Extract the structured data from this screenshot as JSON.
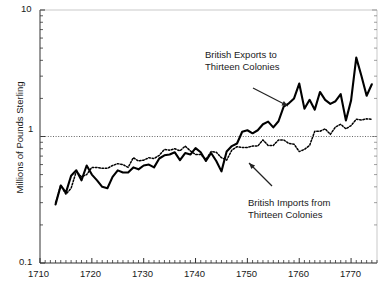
{
  "chart_data": {
    "type": "line",
    "title": "",
    "xlabel": "",
    "ylabel": "Millions of Pounds Sterling",
    "yscale": "log",
    "ylim": [
      0.1,
      10
    ],
    "xlim": [
      1710,
      1775
    ],
    "grid": "dotted horizontal gridline at y = 1",
    "legend_position": "inline annotations with arrows",
    "yticks_major": [
      "0.1",
      "1",
      "10"
    ],
    "xticks_major": [
      "1710",
      "1720",
      "1730",
      "1740",
      "1750",
      "1760",
      "1770"
    ],
    "xtick_minor_interval": 1,
    "annotations": [
      {
        "id": "exports-annotation",
        "line1": "British Exports to",
        "line2": "Thirteen Colonies",
        "arrow_from": [
          253,
          88
        ],
        "arrow_to": [
          288,
          106
        ]
      },
      {
        "id": "imports-annotation",
        "line1": "British Imports from",
        "line2": "Thirteen Colonies",
        "arrow_from": [
          272,
          186
        ],
        "arrow_to": [
          249,
          163
        ]
      }
    ],
    "series": [
      {
        "name": "British Exports to Thirteen Colonies",
        "style": "solid",
        "color": "#000000",
        "x": [
          1713,
          1714,
          1715,
          1716,
          1717,
          1718,
          1719,
          1720,
          1721,
          1722,
          1723,
          1724,
          1725,
          1726,
          1727,
          1728,
          1729,
          1730,
          1731,
          1732,
          1733,
          1734,
          1735,
          1736,
          1737,
          1738,
          1739,
          1740,
          1741,
          1742,
          1743,
          1744,
          1745,
          1746,
          1747,
          1748,
          1749,
          1750,
          1751,
          1752,
          1753,
          1754,
          1755,
          1756,
          1757,
          1758,
          1759,
          1760,
          1761,
          1762,
          1763,
          1764,
          1765,
          1766,
          1767,
          1768,
          1769,
          1770,
          1771,
          1772,
          1773,
          1774
        ],
        "y": [
          0.29,
          0.41,
          0.36,
          0.49,
          0.54,
          0.45,
          0.59,
          0.5,
          0.45,
          0.4,
          0.39,
          0.48,
          0.54,
          0.52,
          0.52,
          0.57,
          0.55,
          0.59,
          0.6,
          0.57,
          0.67,
          0.71,
          0.72,
          0.75,
          0.65,
          0.74,
          0.72,
          0.81,
          0.75,
          0.64,
          0.74,
          0.64,
          0.53,
          0.76,
          0.84,
          0.88,
          1.09,
          1.12,
          1.06,
          1.12,
          1.25,
          1.31,
          1.18,
          1.32,
          1.72,
          1.83,
          2.0,
          2.62,
          1.66,
          1.95,
          1.63,
          2.25,
          1.95,
          1.81,
          1.9,
          2.16,
          1.34,
          1.93,
          4.2,
          3.01,
          2.1,
          2.59
        ]
      },
      {
        "name": "British Imports from Thirteen Colonies",
        "style": "dotted",
        "color": "#000000",
        "x": [
          1713,
          1714,
          1715,
          1716,
          1717,
          1718,
          1719,
          1720,
          1721,
          1722,
          1723,
          1724,
          1725,
          1726,
          1727,
          1728,
          1729,
          1730,
          1731,
          1732,
          1733,
          1734,
          1735,
          1736,
          1737,
          1738,
          1739,
          1740,
          1741,
          1742,
          1743,
          1744,
          1745,
          1746,
          1747,
          1748,
          1749,
          1750,
          1751,
          1752,
          1753,
          1754,
          1755,
          1756,
          1757,
          1758,
          1759,
          1760,
          1761,
          1762,
          1763,
          1764,
          1765,
          1766,
          1767,
          1768,
          1769,
          1770,
          1771,
          1772,
          1773,
          1774
        ],
        "y": [
          0.3,
          0.41,
          0.35,
          0.39,
          0.53,
          0.48,
          0.5,
          0.57,
          0.57,
          0.56,
          0.56,
          0.59,
          0.61,
          0.6,
          0.57,
          0.68,
          0.64,
          0.65,
          0.68,
          0.67,
          0.71,
          0.79,
          0.78,
          0.8,
          0.77,
          0.84,
          0.77,
          0.72,
          0.72,
          0.66,
          0.76,
          0.75,
          0.68,
          0.65,
          0.78,
          0.83,
          0.82,
          0.82,
          0.84,
          0.84,
          0.94,
          0.85,
          0.85,
          0.94,
          0.94,
          0.88,
          0.87,
          0.76,
          0.79,
          0.85,
          1.1,
          1.1,
          1.15,
          1.04,
          1.19,
          1.25,
          1.15,
          1.22,
          1.37,
          1.35,
          1.38,
          1.37
        ]
      }
    ]
  },
  "axes": {
    "y_axis_label": "Millions of Pounds Sterling",
    "y_labels": [
      {
        "value": 10,
        "text": "10"
      },
      {
        "value": 1,
        "text": "1"
      },
      {
        "value": 0.1,
        "text": "0.1"
      }
    ],
    "x_labels": [
      {
        "value": 1710,
        "text": "1710"
      },
      {
        "value": 1720,
        "text": "1720"
      },
      {
        "value": 1730,
        "text": "1730"
      },
      {
        "value": 1740,
        "text": "1740"
      },
      {
        "value": 1750,
        "text": "1750"
      },
      {
        "value": 1760,
        "text": "1760"
      },
      {
        "value": 1770,
        "text": "1770"
      }
    ]
  },
  "annotations": {
    "exports": {
      "line1": "British Exports to",
      "line2": "Thirteen Colonies"
    },
    "imports": {
      "line1": "British Imports from",
      "line2": "Thirteen Colonies"
    }
  },
  "colors": {
    "ink": "#1a1a1a",
    "line": "#000000",
    "gridline": "#555555",
    "background": "#ffffff"
  }
}
